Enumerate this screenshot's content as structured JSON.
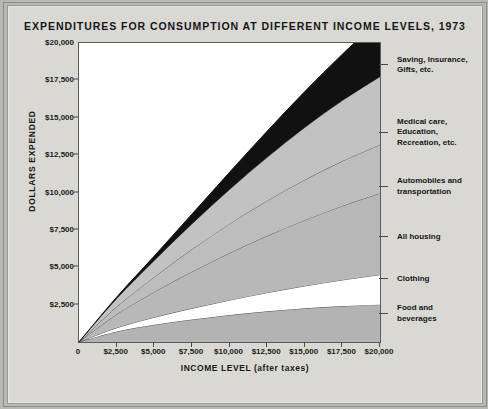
{
  "chart_data": {
    "type": "area",
    "title": "EXPENDITURES FOR CONSUMPTION AT DIFFERENT INCOME LEVELS, 1973",
    "xlabel": "INCOME LEVEL (after taxes)",
    "ylabel": "DOLLARS EXPENDED",
    "xlim": [
      0,
      20000
    ],
    "ylim": [
      0,
      20000
    ],
    "grid": false,
    "legend_position": "right",
    "stacked": true,
    "x": [
      0,
      2500,
      5000,
      7500,
      10000,
      12500,
      15000,
      17500,
      20000
    ],
    "xtick_labels": [
      "0",
      "$2,500",
      "$5,000",
      "$7,500",
      "$10,000",
      "$12,500",
      "$15,000",
      "$17,500",
      "$20,000"
    ],
    "ytick_labels": [
      "$2,500",
      "$5,000",
      "$7,500",
      "$10,000",
      "$12,500",
      "$15,000",
      "$17,500",
      "$20,000"
    ],
    "ytick_values": [
      2500,
      5000,
      7500,
      10000,
      12500,
      15000,
      17500,
      20000
    ],
    "series": [
      {
        "name": "Food and beverages",
        "color": "#b3b3b3",
        "values": [
          0,
          700,
          1150,
          1500,
          1800,
          2050,
          2250,
          2400,
          2500
        ]
      },
      {
        "name": "Clothing",
        "color": "#ffffff",
        "values": [
          0,
          250,
          500,
          750,
          1000,
          1250,
          1500,
          1750,
          2000
        ]
      },
      {
        "name": "All housing",
        "color": "#b8b8b8",
        "values": [
          0,
          900,
          1700,
          2450,
          3150,
          3800,
          4400,
          4950,
          5450
        ]
      },
      {
        "name": "Automobiles and transportation",
        "color": "#bdbdbd",
        "values": [
          0,
          500,
          1000,
          1500,
          1950,
          2350,
          2700,
          3000,
          3250
        ]
      },
      {
        "name": "Medical care, Education, Recreation, etc.",
        "color": "#c2c2c2",
        "values": [
          0,
          550,
          1100,
          1700,
          2300,
          2900,
          3500,
          4050,
          4550
        ]
      },
      {
        "name": "Saving, Insurance, Gifts, etc.",
        "color": "#111111",
        "values": [
          0,
          100,
          300,
          650,
          1150,
          1750,
          2400,
          3100,
          3850
        ]
      }
    ],
    "stack_tops": {
      "food_and_beverages": [
        0,
        700,
        1150,
        1500,
        1800,
        2050,
        2250,
        2400,
        2500
      ],
      "clothing": [
        0,
        950,
        1650,
        2250,
        2800,
        3300,
        3750,
        4150,
        4500
      ],
      "all_housing": [
        0,
        1850,
        3350,
        4700,
        5950,
        7100,
        8150,
        9100,
        9950
      ],
      "automobiles_and_transportation": [
        0,
        2350,
        4350,
        6200,
        7900,
        9450,
        10850,
        12100,
        13200
      ],
      "medical_education_recreation": [
        0,
        2900,
        5450,
        7900,
        10200,
        12350,
        14350,
        16150,
        17750
      ],
      "saving_insurance_gifts": [
        0,
        3000,
        5750,
        8550,
        11350,
        14100,
        16750,
        19250,
        21600
      ]
    },
    "legend_entries": [
      {
        "label": "Saving, Insurance,\nGifts, etc.",
        "anchor_value": 18500
      },
      {
        "label": "Medical care,\nEducation,\nRecreation, etc.",
        "anchor_value": 14000
      },
      {
        "label": "Automobiles and\ntransportation",
        "anchor_value": 10400
      },
      {
        "label": "All housing",
        "anchor_value": 7000
      },
      {
        "label": "Clothing",
        "anchor_value": 4200
      },
      {
        "label": "Food and\nbeverages",
        "anchor_value": 1900
      }
    ]
  },
  "colors": {
    "page_background": "#d9d8d3",
    "plot_background": "#ffffff",
    "axis": "#4a4a4a",
    "text": "#15151a",
    "band_black": "#111111",
    "band_white": "#ffffff",
    "band_gray": "#bdbdbd"
  }
}
